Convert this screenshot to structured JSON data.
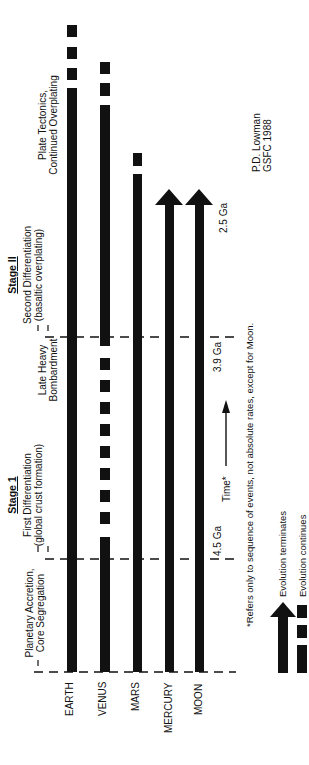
{
  "diagram": {
    "phases": [
      {
        "name": "planetary-accretion",
        "line1": "Planetary Accretion,",
        "line2": "Core Segregation"
      },
      {
        "name": "first-differentiation",
        "line1": "First Differentiation",
        "line2": "(global crust formation)"
      },
      {
        "name": "late-heavy-bombardment",
        "line1": "Late Heavy",
        "line2": "Bombardment"
      },
      {
        "name": "second-differentiation",
        "line1": "Second Differentiation",
        "line2": "(basaltic overplating)"
      },
      {
        "name": "plate-tectonics",
        "line1": "Plate Tectonics,",
        "line2": "Continued Overplating"
      }
    ],
    "stages": [
      {
        "label": "Stage 1"
      },
      {
        "label": "Stage II"
      }
    ],
    "planets": [
      "EARTH",
      "VENUS",
      "MARS",
      "MERCURY",
      "MOON"
    ],
    "time_markers": [
      "4.5 Ga",
      "3.9 Ga",
      "2.5 Ga"
    ],
    "time_axis_label": "Time*",
    "footnote": "*Refers only to sequence of events, not absolute rates, except for Moon.",
    "credit": {
      "line1": "P.D. Lowman",
      "line2": "GSFC 1988"
    },
    "legend": [
      {
        "icon": "arrow-up-icon",
        "label": "Evolution terminates"
      },
      {
        "icon": "dashed-bar-icon",
        "label": "Evolution continues"
      }
    ],
    "colors": {
      "ink": "#111111",
      "background": "#ffffff"
    }
  }
}
